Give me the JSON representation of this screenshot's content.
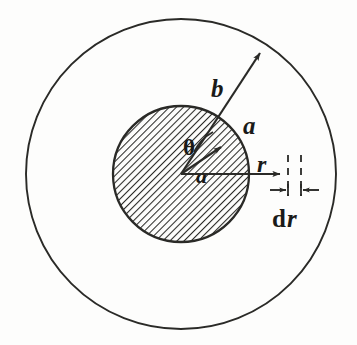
{
  "figure": {
    "background_color": "#fdfdfc",
    "ink_color": "#2a2a27",
    "labels": {
      "outer_radius": "b",
      "inner_radius_outside": "a",
      "inner_radius_inside": "a",
      "angle": "θ",
      "radial_distance": "r",
      "differential_d": "d",
      "differential_r": "r",
      "differential_full": "dr"
    },
    "geometry": {
      "center_x": 181,
      "center_y": 174,
      "outer_circle_radius": 155,
      "inner_circle_radius": 68,
      "hatch_spacing": 5,
      "hatch_angle_deg": 45,
      "b_arrow_tip_x": 263,
      "b_arrow_tip_y": 49,
      "a_arrow_tip_x": 223,
      "a_arrow_tip_y": 144,
      "r_arrow_tip_x": 283,
      "r_arrow_tip_y": 174,
      "dashed_line_1_x": 288,
      "dashed_line_2_x": 300,
      "dashed_line_top_y": 155,
      "dashed_line_bottom_y": 196,
      "theta_angle_deg": 45
    },
    "label_positions": {
      "b": {
        "x": 211,
        "y": 97
      },
      "a_outer": {
        "x": 246,
        "y": 134
      },
      "a_inner": {
        "x": 203,
        "y": 176
      },
      "theta": {
        "x": 190,
        "y": 147
      },
      "r": {
        "x": 262,
        "y": 168
      },
      "dr": {
        "x": 276,
        "y": 219
      }
    }
  }
}
